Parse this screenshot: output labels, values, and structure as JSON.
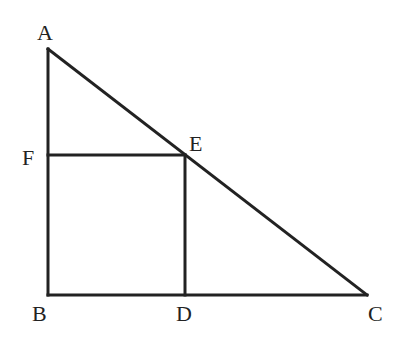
{
  "diagram": {
    "type": "geometry",
    "points": {
      "A": {
        "label": "A",
        "x": 48,
        "y": 49
      },
      "B": {
        "label": "B",
        "x": 48,
        "y": 295
      },
      "C": {
        "label": "C",
        "x": 367,
        "y": 295
      },
      "D": {
        "label": "D",
        "x": 185,
        "y": 295
      },
      "E": {
        "label": "E",
        "x": 185,
        "y": 155
      },
      "F": {
        "label": "F",
        "x": 48,
        "y": 155
      }
    },
    "segments": [
      [
        "A",
        "B"
      ],
      [
        "B",
        "C"
      ],
      [
        "A",
        "C"
      ],
      [
        "F",
        "E"
      ],
      [
        "E",
        "D"
      ]
    ],
    "labels": {
      "A": "A",
      "B": "B",
      "C": "C",
      "D": "D",
      "E": "E",
      "F": "F"
    },
    "line_color": "#222222"
  }
}
